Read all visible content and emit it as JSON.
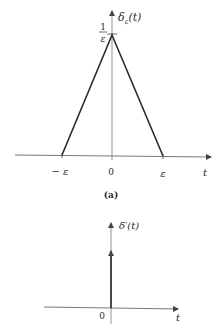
{
  "figure_a": {
    "function_label": "δ",
    "function_subscript": "ε",
    "function_arg": "(t)",
    "peak_label_num": "1",
    "peak_label_den": "ε",
    "tick_left": "− ε",
    "tick_origin": "0",
    "tick_right": "ε",
    "axis_label": "t",
    "caption": "(a)"
  },
  "figure_b": {
    "function_label": "δ′(t)",
    "tick_origin": "0",
    "axis_label": "t"
  },
  "colors": {
    "line": "#2a2a2a",
    "axis": "#555555",
    "background": "#ffffff"
  }
}
